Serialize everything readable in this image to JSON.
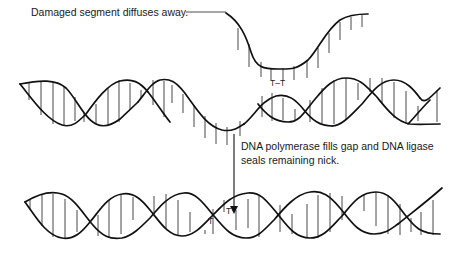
{
  "diagram": {
    "labels": {
      "damaged_segment": "Damaged segment diffuses away.",
      "repair_step_line1": "DNA polymerase fills gap and DNA ligase",
      "repair_step_line2": "seals remaining nick.",
      "dimer_top": "T–T",
      "dimer_bottom_left": "T",
      "dimer_bottom_right": "T"
    },
    "elements": [
      {
        "name": "damaged-segment",
        "description": "Excised single-strand fragment containing thymine dimer (T–T)"
      },
      {
        "name": "gapped-helix",
        "description": "Double helix with single-stranded gap where damaged segment was removed"
      },
      {
        "name": "process-arrow",
        "description": "Downward arrow indicating repair step"
      },
      {
        "name": "repaired-helix",
        "description": "Fully repaired double helix with normal T and T bases"
      }
    ],
    "colors": {
      "stroke": "#111111",
      "rung": "#333333",
      "text": "#1a1a1a",
      "background": "#ffffff"
    }
  }
}
